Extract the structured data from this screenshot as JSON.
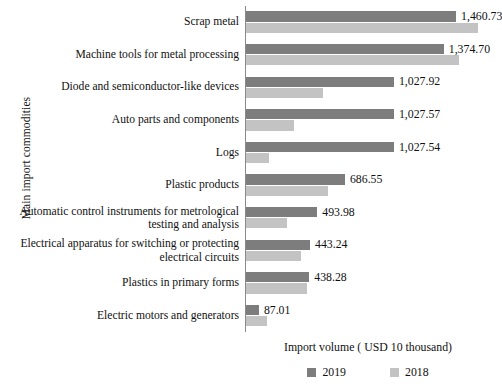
{
  "chart_data": {
    "type": "bar",
    "orientation": "horizontal",
    "title": "",
    "xlabel": "Import volume ( USD 10 thousand)",
    "ylabel": "Main import commodities",
    "grid": false,
    "legend_position": "bottom",
    "xlim": [
      0,
      1600
    ],
    "categories": [
      "Scrap metal",
      "Machine tools for metal processing",
      "Diode and semiconductor-like devices",
      "Auto parts and components",
      "Logs",
      "Plastic products",
      "Automatic control instruments for metrological testing and analysis",
      "Electrical apparatus for switching or protecting electrical circuits",
      "Plastics in primary forms",
      "Electric motors and generators"
    ],
    "series": [
      {
        "name": "2019",
        "color": "#7d7d7d",
        "values": [
          1460.73,
          1374.7,
          1027.92,
          1027.57,
          1027.54,
          686.55,
          493.98,
          443.24,
          438.28,
          87.01
        ],
        "value_labels": [
          "1,460.73",
          "1,374.70",
          "1,027.92",
          "1,027.57",
          "1,027.54",
          "686.55",
          "493.98",
          "443.24",
          "438.28",
          "87.01"
        ]
      },
      {
        "name": "2018",
        "color": "#c3c3c3",
        "values": [
          1616.0,
          1480.0,
          535.0,
          330.0,
          160.0,
          570.0,
          285.0,
          380.0,
          420.0,
          145.0
        ],
        "value_labels": [
          "",
          "",
          "",
          "",
          "",
          "",
          "",
          "",
          "",
          ""
        ]
      }
    ]
  },
  "legend": {
    "items": [
      {
        "label": "2019",
        "color": "#7d7d7d"
      },
      {
        "label": "2018",
        "color": "#c3c3c3"
      }
    ]
  }
}
